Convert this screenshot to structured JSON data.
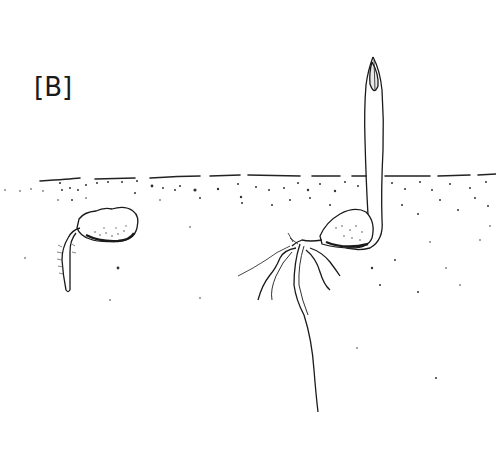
{
  "figure": {
    "panel_label": "[B]",
    "colors": {
      "ink": "#1a1a1a",
      "background": "#ffffff"
    }
  }
}
